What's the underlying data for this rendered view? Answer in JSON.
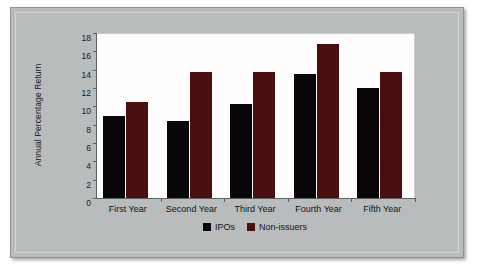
{
  "chart_data": {
    "type": "bar",
    "title": "",
    "xlabel": "",
    "ylabel": "Annual Percentage Return",
    "categories": [
      "First Year",
      "Second Year",
      "Third Year",
      "Fourth Year",
      "Fifth Year"
    ],
    "series": [
      {
        "name": "IPOs",
        "color": "#0a0508",
        "values": [
          9.0,
          8.4,
          10.3,
          13.5,
          12.0
        ]
      },
      {
        "name": "Non-issuers",
        "color": "#4a0f0e",
        "values": [
          10.5,
          13.7,
          13.8,
          16.8,
          13.7
        ]
      }
    ],
    "ylim": [
      0,
      18
    ],
    "yticks": [
      0,
      2,
      4,
      6,
      8,
      10,
      12,
      14,
      16,
      18
    ],
    "ytick_labels": [
      "0",
      "2",
      "4",
      "6",
      "8",
      "10",
      "12",
      "14",
      "16",
      "18"
    ],
    "grid": false,
    "legend_position": "bottom-center"
  },
  "legend": {
    "items": [
      {
        "label": "IPOs",
        "swatch": "black-square"
      },
      {
        "label": "Non-issuers",
        "swatch": "dark-red-square"
      }
    ]
  },
  "colors": {
    "ipos": "#0a0508",
    "nonissuers": "#4a0f0e",
    "card_background": "#b9bdbe",
    "plot_background": "#fefefe",
    "axis": "#5d6265"
  }
}
